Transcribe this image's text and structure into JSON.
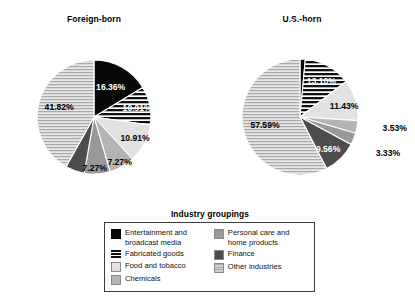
{
  "chart_data": [
    {
      "type": "pie",
      "title": "Foreign-born",
      "categories": [
        "Entertainment and broadcast media",
        "Fabricated goods",
        "Food and tobacco",
        "Chemicals",
        "Personal care and home products",
        "Finance",
        "Other industries"
      ],
      "values": [
        16.36,
        10.91,
        10.91,
        7.27,
        7.27,
        5.45,
        41.82
      ],
      "labels": [
        "16.36%",
        "10.91%",
        "10.91%",
        "7.27%",
        "7.27%",
        "5.45%",
        "41.82%"
      ],
      "unit": "percent",
      "legend_position": "bottom-center"
    },
    {
      "type": "pie",
      "title": "U.S.-born",
      "categories": [
        "Entertainment and broadcast media",
        "Fabricated goods",
        "Food and tobacco",
        "Chemicals",
        "Personal care and home products",
        "Finance",
        "Other industries"
      ],
      "values": [
        1.46,
        13.1,
        11.43,
        3.53,
        3.33,
        9.56,
        57.59
      ],
      "labels": [
        "1.46%",
        "13.10%",
        "11.43%",
        "3.53%",
        "3.33%",
        "9.56%",
        "57.59%"
      ],
      "unit": "percent",
      "legend_position": "bottom-center"
    }
  ],
  "charts": {
    "foreign": {
      "title": "Foreign-born",
      "slices": [
        {
          "label": "16.36%",
          "value": 16.36
        },
        {
          "label": "10.91%",
          "value": 10.91
        },
        {
          "label": "10.91%",
          "value": 10.91
        },
        {
          "label": "7.27%",
          "value": 7.27
        },
        {
          "label": "7.27%",
          "value": 7.27
        },
        {
          "label": "5.45%",
          "value": 5.45
        },
        {
          "label": "41.82%",
          "value": 41.82
        }
      ]
    },
    "usborn": {
      "title": "U.S.-born",
      "slices": [
        {
          "label": "1.46%",
          "value": 1.46
        },
        {
          "label": "13.10%",
          "value": 13.1
        },
        {
          "label": "11.43%",
          "value": 11.43
        },
        {
          "label": "3.53%",
          "value": 3.53
        },
        {
          "label": "3.33%",
          "value": 3.33
        },
        {
          "label": "9.56%",
          "value": 9.56
        },
        {
          "label": "57.59%",
          "value": 57.59
        }
      ]
    }
  },
  "legend": {
    "title": "Industry groupings",
    "left_column": [
      {
        "label": "Entertainment and\nbroadcast media",
        "swatch": "solid-black"
      },
      {
        "label": "Fabricated goods",
        "swatch": "black-horizontal-stripes"
      },
      {
        "label": "Food and tobacco",
        "swatch": "very-light-gray"
      },
      {
        "label": "Chemicals",
        "swatch": "medium-gray"
      }
    ],
    "right_column": [
      {
        "label": "Personal care and\nhome products",
        "swatch": "gray"
      },
      {
        "label": "Finance",
        "swatch": "dark-gray"
      },
      {
        "label": "Other industries",
        "swatch": "light-gray-horizontal-lines"
      }
    ]
  },
  "colors": {
    "solid_black": "#080808",
    "stripes_black": "#111111",
    "very_light_gray": "#e2e2e2",
    "medium_gray": "#b4b4b4",
    "gray": "#999999",
    "dark_gray": "#4d4d4d",
    "light_gray_lines": "#d2d2d2",
    "background": "#ffffff",
    "legend_border": "#3c3c3c"
  }
}
